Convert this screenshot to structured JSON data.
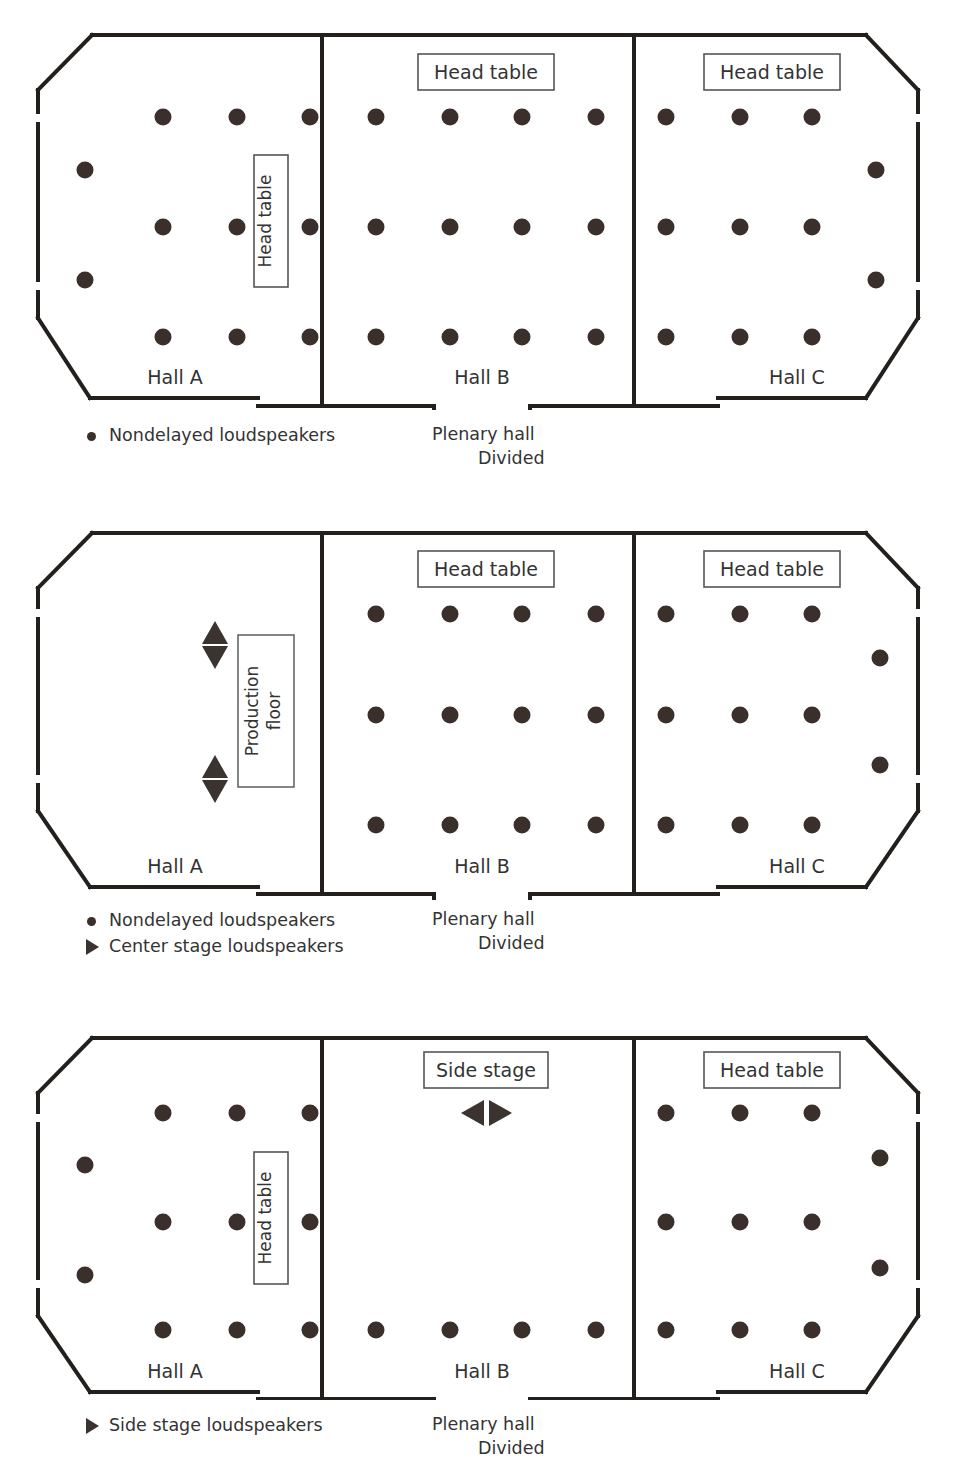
{
  "diagrams": [
    {
      "id": "plenary-nondelayed",
      "halls": [
        {
          "name": "Hall A",
          "label": "Hall A"
        },
        {
          "name": "Hall B",
          "label": "Hall B"
        },
        {
          "name": "Hall C",
          "label": "Hall C"
        }
      ],
      "head_tables": [
        {
          "label": "Head table",
          "orientation": "vertical",
          "hall": "Hall A"
        },
        {
          "label": "Head table",
          "orientation": "horizontal",
          "hall": "Hall B"
        },
        {
          "label": "Head table",
          "orientation": "horizontal",
          "hall": "Hall C"
        }
      ],
      "stage_markers": [],
      "legend": [
        {
          "symbol": "dot",
          "label": "Nondelayed loudspeakers"
        }
      ],
      "plenary_caption": {
        "line1": "Plenary hall",
        "line2": "Divided"
      }
    },
    {
      "id": "plenary-center-stage",
      "halls": [
        {
          "name": "Hall A",
          "label": "Hall A"
        },
        {
          "name": "Hall B",
          "label": "Hall B"
        },
        {
          "name": "Hall C",
          "label": "Hall C"
        }
      ],
      "head_tables": [
        {
          "label": "Production floor",
          "orientation": "vertical",
          "hall": "Hall A"
        },
        {
          "label": "Head table",
          "orientation": "horizontal",
          "hall": "Hall B"
        },
        {
          "label": "Head table",
          "orientation": "horizontal",
          "hall": "Hall C"
        }
      ],
      "stage_markers": [
        {
          "type": "updown-arrows",
          "hall": "Hall A"
        },
        {
          "type": "updown-arrows",
          "hall": "Hall A"
        }
      ],
      "legend": [
        {
          "symbol": "dot",
          "label": "Nondelayed loudspeakers"
        },
        {
          "symbol": "tri",
          "label": "Center stage loudspeakers"
        }
      ],
      "plenary_caption": {
        "line1": "Plenary hall",
        "line2": "Divided"
      }
    },
    {
      "id": "plenary-side-stage",
      "halls": [
        {
          "name": "Hall A",
          "label": "Hall A"
        },
        {
          "name": "Hall B",
          "label": "Hall B"
        },
        {
          "name": "Hall C",
          "label": "Hall C"
        }
      ],
      "head_tables": [
        {
          "label": "Head table",
          "orientation": "vertical",
          "hall": "Hall A"
        },
        {
          "label": "Side stage",
          "orientation": "horizontal",
          "hall": "Hall B"
        },
        {
          "label": "Head table",
          "orientation": "horizontal",
          "hall": "Hall C"
        }
      ],
      "stage_markers": [
        {
          "type": "leftright-arrows",
          "hall": "Hall B"
        }
      ],
      "legend": [
        {
          "symbol": "tri",
          "label": "Side stage loudspeakers"
        }
      ],
      "plenary_caption": {
        "line1": "Plenary hall",
        "line2": "Divided"
      }
    }
  ],
  "colors": {
    "wall": "#231f1d",
    "loudspeaker": "#3a2f2b",
    "text": "#333333",
    "background": "#ffffff"
  },
  "labels": {
    "hall_a": "Hall A",
    "hall_b": "Hall B",
    "hall_c": "Hall C",
    "head_table": "Head table",
    "production_floor_line1": "Production",
    "production_floor_line2": "floor",
    "side_stage": "Side stage",
    "nondelayed": "Nondelayed loudspeakers",
    "center_stage": "Center stage loudspeakers",
    "side_stage_ls": "Side stage loudspeakers",
    "plenary_hall": "Plenary hall",
    "divided": "Divided"
  }
}
